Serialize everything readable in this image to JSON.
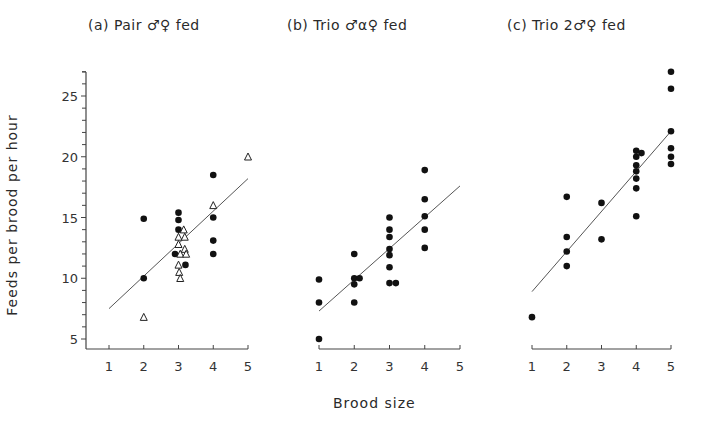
{
  "figure": {
    "ylabel": "Feeds  per  brood  per  hour",
    "xlabel": "Brood  size"
  },
  "chart_data": [
    {
      "type": "scatter",
      "title": "(a)  Pair ♂♀  fed",
      "xlabel": "Brood size",
      "ylabel": "Feeds per brood per hour",
      "xlim": [
        0.65,
        5.0
      ],
      "ylim": [
        4.2,
        27.2
      ],
      "xticks": [
        1,
        2,
        3,
        4,
        5
      ],
      "yticks": [
        5,
        10,
        15,
        20,
        25
      ],
      "grid": false,
      "series": [
        {
          "name": "filled circles",
          "marker": "circle-filled",
          "points": [
            [
              2,
              14.9
            ],
            [
              2,
              10.0
            ],
            [
              3,
              15.4
            ],
            [
              3,
              14.8
            ],
            [
              3,
              14.0
            ],
            [
              2.9,
              12.0
            ],
            [
              3.2,
              11.1
            ],
            [
              4,
              18.5
            ],
            [
              4,
              15.0
            ],
            [
              4,
              13.1
            ],
            [
              4,
              12.0
            ]
          ]
        },
        {
          "name": "open triangles",
          "marker": "triangle-open",
          "points": [
            [
              2,
              6.8
            ],
            [
              3.15,
              14.0
            ],
            [
              3.0,
              13.4
            ],
            [
              3.18,
              13.4
            ],
            [
              3.0,
              12.8
            ],
            [
              3.18,
              12.4
            ],
            [
              3.05,
              12.0
            ],
            [
              3.22,
              12.0
            ],
            [
              3.0,
              11.1
            ],
            [
              3.02,
              10.5
            ],
            [
              3.05,
              10.0
            ],
            [
              4,
              16.0
            ],
            [
              5,
              20.0
            ]
          ]
        }
      ],
      "regression_line": {
        "x": [
          1,
          5
        ],
        "y": [
          7.5,
          18.2
        ]
      }
    },
    {
      "type": "scatter",
      "title": "(b)  Trio ♂α♀  fed",
      "xlabel": "Brood size",
      "ylabel": "Feeds per brood per hour",
      "xlim": [
        1,
        5
      ],
      "ylim": [
        4.2,
        27.2
      ],
      "xticks": [
        1,
        2,
        3,
        4,
        5
      ],
      "grid": false,
      "series": [
        {
          "name": "filled circles",
          "marker": "circle-filled",
          "points": [
            [
              1,
              9.9
            ],
            [
              1,
              8.0
            ],
            [
              1,
              5.0
            ],
            [
              2,
              12.0
            ],
            [
              2,
              10.0
            ],
            [
              2.15,
              10.0
            ],
            [
              2,
              9.5
            ],
            [
              2,
              8.0
            ],
            [
              3,
              15.0
            ],
            [
              3,
              14.0
            ],
            [
              3,
              13.4
            ],
            [
              3,
              12.4
            ],
            [
              3,
              11.9
            ],
            [
              3,
              10.9
            ],
            [
              3,
              9.6
            ],
            [
              3.18,
              9.6
            ],
            [
              4,
              18.9
            ],
            [
              4,
              16.5
            ],
            [
              4,
              15.1
            ],
            [
              4,
              14.0
            ],
            [
              4,
              12.5
            ]
          ]
        }
      ],
      "regression_line": {
        "x": [
          1,
          5
        ],
        "y": [
          7.3,
          17.6
        ]
      }
    },
    {
      "type": "scatter",
      "title": "(c)  Trio  2♂♀  fed",
      "xlabel": "Brood size",
      "ylabel": "Feeds per brood per hour",
      "xlim": [
        1,
        5
      ],
      "ylim": [
        4.2,
        27.2
      ],
      "xticks": [
        1,
        2,
        3,
        4,
        5
      ],
      "grid": false,
      "series": [
        {
          "name": "filled circles",
          "marker": "circle-filled",
          "points": [
            [
              1,
              6.8
            ],
            [
              2,
              16.7
            ],
            [
              2,
              13.4
            ],
            [
              2,
              12.2
            ],
            [
              2,
              11.0
            ],
            [
              3,
              16.2
            ],
            [
              3,
              13.2
            ],
            [
              4,
              20.5
            ],
            [
              4.15,
              20.3
            ],
            [
              4,
              20.0
            ],
            [
              4,
              19.3
            ],
            [
              4,
              18.8
            ],
            [
              4,
              18.2
            ],
            [
              4,
              17.4
            ],
            [
              4,
              15.1
            ],
            [
              5,
              27.0
            ],
            [
              5,
              25.6
            ],
            [
              5,
              22.1
            ],
            [
              5,
              20.7
            ],
            [
              5,
              20.0
            ],
            [
              5,
              19.4
            ]
          ]
        }
      ],
      "regression_line": {
        "x": [
          1,
          5
        ],
        "y": [
          8.9,
          22.1
        ]
      }
    }
  ],
  "layout": {
    "panels": [
      {
        "x1px": 109,
        "x5px": 248,
        "axis_left_px": 86,
        "axis_right_px": 248,
        "title_left_px": 88
      },
      {
        "x1px": 319,
        "x5px": 460,
        "axis_left_px": 319,
        "axis_right_px": 460,
        "title_left_px": 287
      },
      {
        "x1px": 532,
        "x5px": 671,
        "axis_left_px": 532,
        "axis_right_px": 671,
        "title_left_px": 507
      }
    ],
    "y_px_at_5": 339,
    "y_px_at_25": 96,
    "x_axis_y_px": 349,
    "y_axis_top_px": 72
  }
}
